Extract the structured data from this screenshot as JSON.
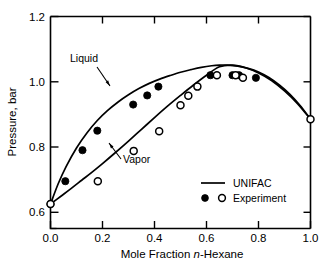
{
  "chart_data": {
    "type": "line",
    "title": "",
    "xlabel": "Mole Fraction n-Hexane",
    "ylabel": "Pressure, bar",
    "xlim": [
      0.0,
      1.0
    ],
    "ylim": [
      0.55,
      1.2
    ],
    "grid": false,
    "xticks": [
      "0.0",
      "0.2",
      "0.4",
      "0.6",
      "0.8",
      "1.0"
    ],
    "xtick_values": [
      0.0,
      0.2,
      0.4,
      0.6,
      0.8,
      1.0
    ],
    "yticks": [
      "0.6",
      "0.8",
      "1.0",
      "1.2"
    ],
    "ytick_values": [
      0.6,
      0.8,
      1.0,
      1.2
    ],
    "y_minor_ticks": [
      0.55
    ],
    "series": [
      {
        "name": "UNIFAC liquid (bubble-point) curve",
        "kind": "line",
        "x": [
          0.0,
          0.03,
          0.06,
          0.1,
          0.14,
          0.18,
          0.22,
          0.26,
          0.3,
          0.34,
          0.38,
          0.42,
          0.46,
          0.5,
          0.54,
          0.58,
          0.62,
          0.65,
          0.68,
          0.72,
          0.76,
          0.8,
          0.84,
          0.88,
          0.92,
          0.96,
          1.0
        ],
        "y": [
          0.625,
          0.688,
          0.74,
          0.797,
          0.843,
          0.881,
          0.912,
          0.938,
          0.96,
          0.979,
          0.995,
          1.008,
          1.019,
          1.029,
          1.037,
          1.044,
          1.049,
          1.051,
          1.051,
          1.048,
          1.041,
          1.03,
          1.013,
          0.99,
          0.962,
          0.927,
          0.885
        ]
      },
      {
        "name": "UNIFAC vapor (dew-point) curve",
        "kind": "line",
        "x": [
          0.0,
          0.04,
          0.08,
          0.12,
          0.16,
          0.2,
          0.25,
          0.3,
          0.35,
          0.4,
          0.45,
          0.5,
          0.55,
          0.6,
          0.65,
          0.7,
          0.75,
          0.8,
          0.85,
          0.9,
          0.95,
          1.0
        ],
        "y": [
          0.625,
          0.649,
          0.673,
          0.698,
          0.723,
          0.749,
          0.783,
          0.818,
          0.854,
          0.89,
          0.925,
          0.958,
          0.99,
          1.02,
          1.046,
          1.051,
          1.043,
          1.027,
          1.004,
          0.972,
          0.933,
          0.885
        ]
      },
      {
        "name": "Experiment liquid",
        "kind": "scatter",
        "marker": "filled-circle",
        "x": [
          0.0,
          0.057,
          0.123,
          0.18,
          0.318,
          0.372,
          0.415,
          0.615,
          0.7,
          0.725,
          0.79
        ],
        "y": [
          0.625,
          0.695,
          0.79,
          0.85,
          0.93,
          0.958,
          0.985,
          1.02,
          1.02,
          1.02,
          1.012
        ]
      },
      {
        "name": "Experiment vapor",
        "kind": "scatter",
        "marker": "open-circle",
        "x": [
          0.0,
          0.182,
          0.32,
          0.418,
          0.5,
          0.53,
          0.565,
          0.64,
          0.712,
          0.74,
          1.0
        ],
        "y": [
          0.625,
          0.695,
          0.788,
          0.848,
          0.928,
          0.957,
          0.985,
          1.02,
          1.02,
          1.012,
          0.885
        ]
      }
    ],
    "annotations": [
      {
        "text": "Liquid",
        "x": 0.13,
        "y": 1.085
      },
      {
        "text": "Vapor",
        "x": 0.4,
        "y": 0.76
      }
    ],
    "legend": {
      "position": "lower-right",
      "entries": [
        {
          "label": "UNIFAC",
          "marker": "line"
        },
        {
          "label": "Experiment",
          "marker": "filled-circle,open-circle"
        }
      ]
    },
    "colors": {
      "curve": "#000000",
      "filled_marker": "#000000",
      "open_marker_fill": "#ffffff",
      "axis": "#000000",
      "background": "#ffffff"
    }
  },
  "figure": {
    "xlabel_prefix": "Mole Fraction ",
    "xlabel_italic": "n",
    "xlabel_suffix": "-Hexane",
    "ylabel": "Pressure, bar",
    "annotation_liquid": "Liquid",
    "annotation_vapor": "Vapor",
    "legend_unifac": "UNIFAC",
    "legend_experiment": "Experiment",
    "xtick_0": "0.0",
    "xtick_1": "0.2",
    "xtick_2": "0.4",
    "xtick_3": "0.6",
    "xtick_4": "0.8",
    "xtick_5": "1.0",
    "ytick_0": "0.6",
    "ytick_1": "0.8",
    "ytick_2": "1.0",
    "ytick_3": "1.2"
  }
}
